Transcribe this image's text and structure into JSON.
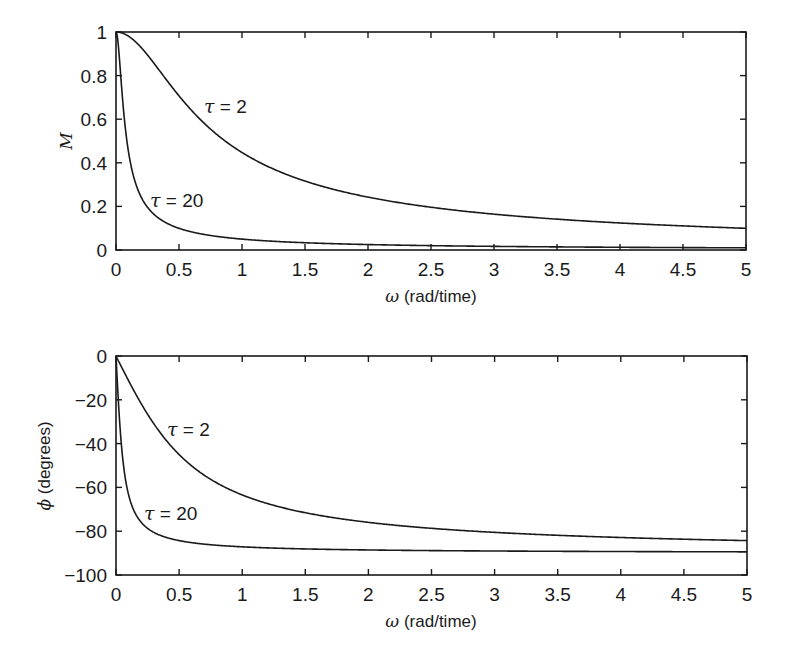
{
  "chart_data": [
    {
      "type": "line",
      "title": "",
      "xlabel": "ω (rad/time)",
      "ylabel": "M",
      "xlim": [
        0,
        5
      ],
      "ylim": [
        0,
        1
      ],
      "grid": false,
      "x_ticks": [
        "0",
        "0.5",
        "1",
        "1.5",
        "2",
        "2.5",
        "3",
        "3.5",
        "4",
        "4.5",
        "5"
      ],
      "y_ticks": [
        "0",
        "0.2",
        "0.4",
        "0.6",
        "0.8",
        "1"
      ],
      "series": [
        {
          "name": "τ = 2",
          "tau": 2,
          "x": [
            0,
            0.25,
            0.5,
            0.75,
            1,
            1.5,
            2,
            2.5,
            3,
            3.5,
            4,
            4.5,
            5
          ],
          "values": [
            1.0,
            0.89,
            0.71,
            0.55,
            0.45,
            0.32,
            0.24,
            0.2,
            0.16,
            0.14,
            0.12,
            0.11,
            0.1
          ]
        },
        {
          "name": "τ = 20",
          "tau": 20,
          "x": [
            0,
            0.05,
            0.1,
            0.2,
            0.3,
            0.5,
            1,
            2,
            3,
            4,
            5
          ],
          "values": [
            1.0,
            0.71,
            0.45,
            0.24,
            0.16,
            0.1,
            0.05,
            0.025,
            0.017,
            0.012,
            0.01
          ]
        }
      ],
      "annotations": [
        {
          "text": "τ = 2",
          "x": 0.72,
          "y": 0.62
        },
        {
          "text": "τ = 20",
          "x": 0.12,
          "y": 0.2
        }
      ]
    },
    {
      "type": "line",
      "title": "",
      "xlabel": "ω (rad/time)",
      "ylabel": "ϕ (degrees)",
      "xlim": [
        0,
        5
      ],
      "ylim": [
        -100,
        0
      ],
      "grid": false,
      "x_ticks": [
        "0",
        "0.5",
        "1",
        "1.5",
        "2",
        "2.5",
        "3",
        "3.5",
        "4",
        "4.5",
        "5"
      ],
      "y_ticks": [
        "−100",
        "−80",
        "−60",
        "−40",
        "−20",
        "0"
      ],
      "series": [
        {
          "name": "τ = 2",
          "tau": 2,
          "x": [
            0,
            0.25,
            0.5,
            0.75,
            1,
            1.5,
            2,
            2.5,
            3,
            3.5,
            4,
            4.5,
            5
          ],
          "values": [
            0,
            -26.6,
            -45,
            -56.3,
            -63.4,
            -71.6,
            -76,
            -78.7,
            -80.5,
            -81.9,
            -82.9,
            -83.7,
            -84.3
          ]
        },
        {
          "name": "τ = 20",
          "tau": 20,
          "x": [
            0,
            0.05,
            0.1,
            0.2,
            0.3,
            0.5,
            1,
            2,
            3,
            4,
            5
          ],
          "values": [
            0,
            -45,
            -63.4,
            -76,
            -80.5,
            -84.3,
            -87.1,
            -88.6,
            -89.0,
            -89.3,
            -89.4
          ]
        }
      ],
      "annotations": [
        {
          "text": "τ = 2",
          "x": 0.42,
          "y": -32
        },
        {
          "text": "τ = 20",
          "x": 0.1,
          "y": -72
        }
      ]
    }
  ],
  "labels": {
    "top_ylabel": "M",
    "top_xlabel_sym": "ω",
    "top_xlabel_rest": " (rad/time)",
    "bottom_ylabel_sym": "ϕ",
    "bottom_ylabel_rest": " (degrees)",
    "bottom_xlabel_sym": "ω",
    "bottom_xlabel_rest": " (rad/time)",
    "tau_sym": "τ",
    "tau2_rest": " = 2",
    "tau20_rest": " = 20"
  },
  "colors": {
    "line": "#1a1a1a",
    "background": "#ffffff"
  }
}
